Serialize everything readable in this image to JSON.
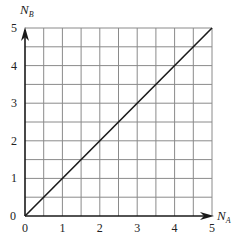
{
  "chart_data": {
    "type": "line",
    "title": "",
    "xlabel": "N_A",
    "ylabel": "N_B",
    "xlabel_main": "N",
    "xlabel_sub": "A",
    "ylabel_main": "N",
    "ylabel_sub": "B",
    "xlim": [
      0,
      5
    ],
    "ylim": [
      0,
      5
    ],
    "grid": true,
    "grid_step": 0.5,
    "xticks": [
      0,
      1,
      2,
      3,
      4,
      5
    ],
    "yticks": [
      0,
      1,
      2,
      3,
      4,
      5
    ],
    "xtick_labels": [
      "0",
      "1",
      "2",
      "3",
      "4",
      "5"
    ],
    "ytick_labels": [
      "0",
      "1",
      "2",
      "3",
      "4",
      "5"
    ],
    "series": [
      {
        "name": "N_B = N_A",
        "x": [
          0,
          5
        ],
        "y": [
          0,
          5
        ],
        "color": "#1a1a1a"
      }
    ],
    "legend": "none"
  }
}
